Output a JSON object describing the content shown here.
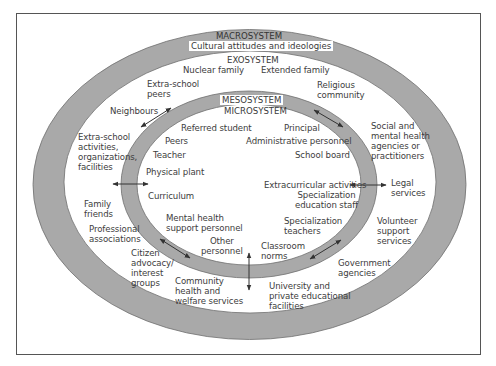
{
  "diagram": {
    "type": "nested-ellipses",
    "colors": {
      "ring": "#a9a9a9",
      "ring_stroke": "#6f6f6f",
      "background": "#ffffff",
      "text": "#3a3a3a",
      "frame": "#555555"
    },
    "macrosystem": {
      "title": "MACROSYSTEM",
      "subtitle": "Cultural attitudes and ideologies"
    },
    "exosystem": {
      "title": "EXOSYSTEM",
      "items": [
        "Nuclear family",
        "Extended family",
        "Extra-school\npeers",
        "Religious\ncommunity",
        "Neighbours",
        "Social and\nmental health\nagencies or\npractitioners",
        "Extra-school\nactivities,\norganizations,\nfacilities",
        "Legal\nservices",
        "Family\nfriends",
        "Professional\nassociations",
        "Volunteer\nsupport\nservices",
        "Citizen\nadvocacy/\ninterest\ngroups",
        "Government\nagencies",
        "Community\nhealth and\nwelfare services",
        "University and\nprivate educational\nfacilities"
      ]
    },
    "mesosystem": {
      "title": "MESOSYSTEM"
    },
    "microsystem": {
      "title": "MICROSYSTEM",
      "items": [
        "Referred student",
        "Principal",
        "Peers",
        "Administrative personnel",
        "Teacher",
        "School board",
        "Physical plant",
        "Extracurricular activities",
        "Curriculum",
        "Specialization\neducation staff",
        "Mental health\nsupport personnel",
        "Specialization\nteachers",
        "Other\npersonnel",
        "Classroom\nnorms"
      ]
    },
    "arrows": [
      "top-left",
      "top-right",
      "left",
      "right",
      "bottom-left",
      "bottom-right",
      "bottom"
    ]
  }
}
